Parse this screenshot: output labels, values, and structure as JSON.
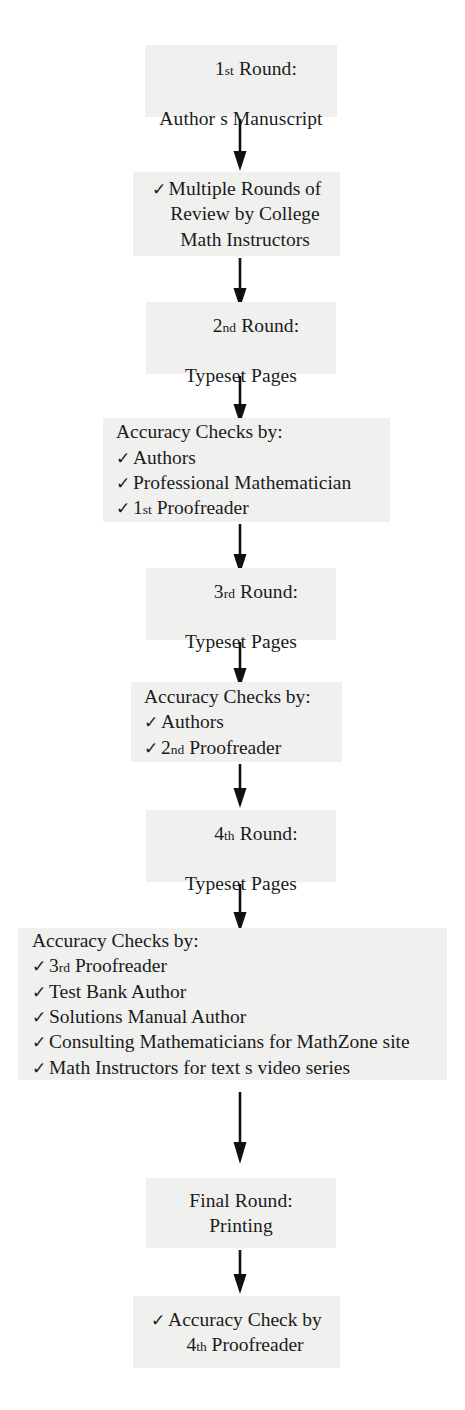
{
  "document": {
    "title": "Accuracy Review Process",
    "type": "flowchart",
    "orientation": "top-to-bottom",
    "background_color": "#ffffff",
    "box_fill_color": "#f0f0ef",
    "text_color": "#1b1b1b",
    "arrow_color": "#111111",
    "check_glyph": "✓"
  },
  "nodes": [
    {
      "id": "round-1",
      "kind": "round",
      "lines": [
        {
          "pre": "1",
          "ord": "st",
          "post": " Round:"
        },
        {
          "pre": "Author s Manuscript",
          "ord": "",
          "post": ""
        }
      ]
    },
    {
      "id": "multiple-rounds-review",
      "kind": "check-block-centered",
      "items": [
        "Multiple Rounds of",
        "Review by College",
        "Math Instructors"
      ],
      "checked_first_line_only": true
    },
    {
      "id": "round-2",
      "kind": "round",
      "lines": [
        {
          "pre": "2",
          "ord": "nd",
          "post": " Round:"
        },
        {
          "pre": "Typeset Pages",
          "ord": "",
          "post": ""
        }
      ]
    },
    {
      "id": "accuracy-checks-1",
      "kind": "check-list",
      "heading": "Accuracy Checks by:",
      "items": [
        {
          "pre": "Authors",
          "ord": "",
          "post": ""
        },
        {
          "pre": "Professional Mathematician",
          "ord": "",
          "post": ""
        },
        {
          "pre": "1",
          "ord": "st",
          "post": " Proofreader"
        }
      ]
    },
    {
      "id": "round-3",
      "kind": "round",
      "lines": [
        {
          "pre": "3",
          "ord": "rd",
          "post": " Round:"
        },
        {
          "pre": "Typeset Pages",
          "ord": "",
          "post": ""
        }
      ]
    },
    {
      "id": "accuracy-checks-2",
      "kind": "check-list",
      "heading": "Accuracy Checks by:",
      "items": [
        {
          "pre": "Authors",
          "ord": "",
          "post": ""
        },
        {
          "pre": "2",
          "ord": "nd",
          "post": " Proofreader"
        }
      ]
    },
    {
      "id": "round-4",
      "kind": "round",
      "lines": [
        {
          "pre": "4",
          "ord": "th",
          "post": " Round:"
        },
        {
          "pre": "Typeset Pages",
          "ord": "",
          "post": ""
        }
      ]
    },
    {
      "id": "accuracy-checks-3",
      "kind": "check-list",
      "heading": "Accuracy Checks by:",
      "items": [
        {
          "pre": "3",
          "ord": "rd",
          "post": " Proofreader"
        },
        {
          "pre": "Test Bank Author",
          "ord": "",
          "post": ""
        },
        {
          "pre": "Solutions Manual Author",
          "ord": "",
          "post": ""
        },
        {
          "pre": "Consulting Mathematicians for MathZone site",
          "ord": "",
          "post": ""
        },
        {
          "pre": "Math Instructors for text s video series",
          "ord": "",
          "post": ""
        }
      ]
    },
    {
      "id": "final-round",
      "kind": "round",
      "lines": [
        {
          "pre": "Final Round:",
          "ord": "",
          "post": ""
        },
        {
          "pre": "Printing",
          "ord": "",
          "post": ""
        }
      ]
    },
    {
      "id": "accuracy-check-final",
      "kind": "check-block-centered",
      "items": [
        "Accuracy Check by",
        "4th Proofreader"
      ],
      "final_lines": [
        {
          "pre": "Accuracy Check by",
          "ord": "",
          "post": ""
        },
        {
          "pre": "4",
          "ord": "th",
          "post": " Proofreader"
        }
      ]
    }
  ],
  "connectors": [
    {
      "id": "arrow-1",
      "from": "round-1",
      "to": "multiple-rounds-review"
    },
    {
      "id": "arrow-2",
      "from": "multiple-rounds-review",
      "to": "round-2"
    },
    {
      "id": "arrow-3",
      "from": "round-2",
      "to": "accuracy-checks-1"
    },
    {
      "id": "arrow-4",
      "from": "accuracy-checks-1",
      "to": "round-3"
    },
    {
      "id": "arrow-5",
      "from": "round-3",
      "to": "accuracy-checks-2"
    },
    {
      "id": "arrow-6",
      "from": "accuracy-checks-2",
      "to": "round-4"
    },
    {
      "id": "arrow-7",
      "from": "round-4",
      "to": "accuracy-checks-3"
    },
    {
      "id": "arrow-8",
      "from": "accuracy-checks-3",
      "to": "final-round"
    },
    {
      "id": "arrow-9",
      "from": "final-round",
      "to": "accuracy-check-final"
    }
  ]
}
